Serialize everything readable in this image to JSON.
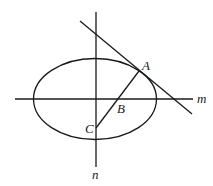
{
  "diagram": {
    "type": "geometry",
    "stroke_color": "#1a1a1a",
    "background": "#ffffff",
    "ellipse": {
      "cx": 95,
      "cy": 99,
      "rx": 61.5,
      "ry": 40.5
    },
    "line_m": {
      "label": "m",
      "x1": 15,
      "y1": 99,
      "x2": 193,
      "y2": 99,
      "label_x": 197,
      "label_y": 103
    },
    "line_n": {
      "label": "n",
      "x1": 96,
      "y1": 12,
      "x2": 96,
      "y2": 167,
      "label_x": 92,
      "label_y": 179
    },
    "tangent": {
      "x1": 80,
      "y1": 21,
      "x2": 192,
      "y2": 114
    },
    "segment_AC": {
      "x1": 139,
      "y1": 71,
      "x2": 96,
      "y2": 128
    },
    "points": [
      {
        "name": "A",
        "x": 139,
        "y": 71,
        "label_x": 142,
        "label_y": 70
      },
      {
        "name": "B",
        "x": 118,
        "y": 99,
        "label_x": 117,
        "label_y": 113
      },
      {
        "name": "C",
        "x": 96,
        "y": 128,
        "label_x": 85,
        "label_y": 133
      }
    ]
  }
}
